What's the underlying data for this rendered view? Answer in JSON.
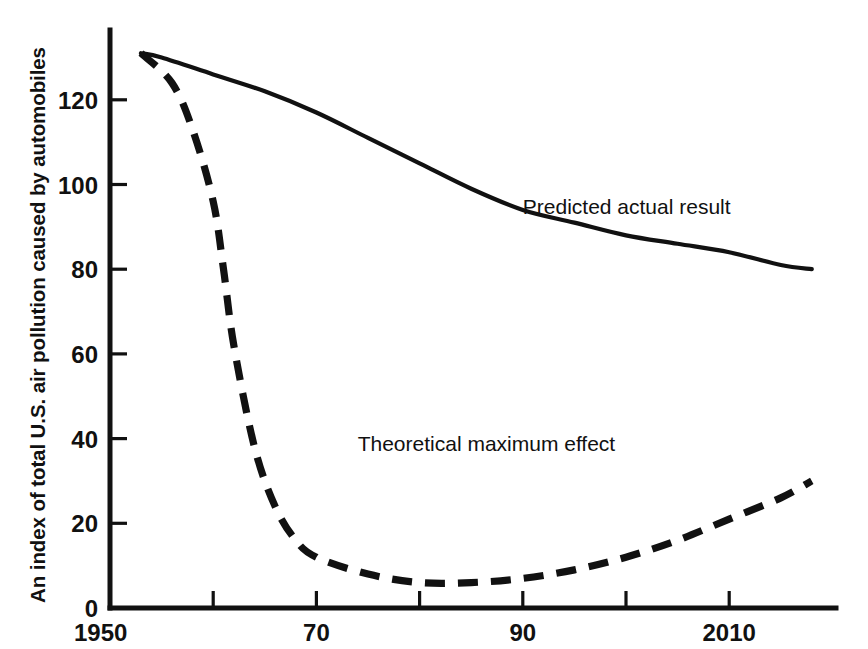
{
  "chart_data": {
    "type": "line",
    "title": "",
    "subtitle": "",
    "xlabel": "",
    "ylabel": "An index of total U.S. air pollution caused by automobiles",
    "xlim": [
      1950,
      2020
    ],
    "ylim": [
      0,
      137
    ],
    "grid": false,
    "legend_position": "inline-annotations",
    "x_ticks": [
      1950,
      1960,
      1970,
      1980,
      1990,
      2000,
      2010
    ],
    "x_tick_labels": [
      "1950",
      "",
      "70",
      "",
      "90",
      "",
      "2010"
    ],
    "y_ticks": [
      0,
      20,
      40,
      60,
      80,
      100,
      120
    ],
    "y_tick_labels": [
      "0",
      "20",
      "40",
      "60",
      "80",
      "100",
      "120"
    ],
    "series": [
      {
        "name": "Predicted actual result",
        "style": "solid",
        "label_x": 1990,
        "label_y": 93,
        "x": [
          1953,
          1955,
          1960,
          1965,
          1970,
          1975,
          1980,
          1985,
          1990,
          1995,
          2000,
          2005,
          2010,
          2015,
          2018
        ],
        "values": [
          131,
          130,
          126,
          122,
          117,
          111,
          105,
          99,
          94,
          91,
          88,
          86,
          84,
          81,
          80
        ]
      },
      {
        "name": "Theoretical maximum effect",
        "style": "dashed",
        "label_x": 1974,
        "label_y": 37,
        "x": [
          1953,
          1956,
          1958,
          1960,
          1961,
          1962,
          1964,
          1966,
          1968,
          1970,
          1975,
          1980,
          1985,
          1990,
          1995,
          2000,
          2005,
          2010,
          2015,
          2018
        ],
        "values": [
          131,
          124,
          113,
          96,
          80,
          62,
          38,
          24,
          16,
          12,
          8,
          6,
          6,
          7,
          9,
          12,
          16,
          21,
          26,
          30
        ]
      }
    ]
  },
  "annotations": {
    "predicted_actual_result": "Predicted actual result",
    "theoretical_maximum_effect": "Theoretical maximum effect"
  },
  "axis_titles": {
    "y": "An index of total U.S. air pollution caused by automobiles",
    "x": ""
  },
  "colors": {
    "ink": "#111111",
    "background": "#ffffff"
  }
}
